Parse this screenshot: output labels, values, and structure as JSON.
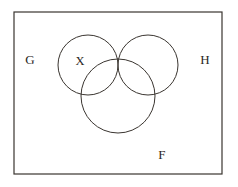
{
  "figure": {
    "type": "venn-diagram",
    "background_color": "#ffffff",
    "stroke_color": "#3a3530",
    "shade_color": "#3a3633",
    "universe": {
      "shape": "rectangle",
      "label": "",
      "x": 14,
      "y": 12,
      "width": 208,
      "height": 162,
      "stroke_width": 1.2
    },
    "sets": [
      {
        "id": "G",
        "label": "G",
        "cx": 88,
        "cy": 65,
        "r": 30,
        "label_x": 30,
        "label_y": 61
      },
      {
        "id": "H",
        "label": "H",
        "cx": 148,
        "cy": 65,
        "r": 30,
        "label_x": 205,
        "label_y": 61
      },
      {
        "id": "F",
        "label": "F",
        "cx": 118,
        "cy": 96,
        "r": 37,
        "label_x": 162,
        "label_y": 156
      }
    ],
    "region_labels": [
      {
        "id": "X",
        "label": "X",
        "x": 80,
        "y": 62,
        "description": "region inside G only"
      }
    ],
    "shaded_region": {
      "id": "G-intersect-H",
      "description": "intersection of sets G and H",
      "fill": "#3a3633",
      "top_point_x": 118,
      "top_point_y": 33,
      "bottom_point_x": 118,
      "bottom_point_y": 97
    }
  }
}
